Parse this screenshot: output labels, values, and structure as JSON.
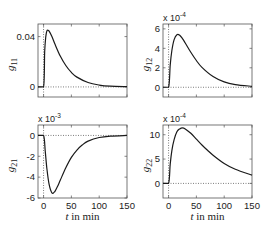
{
  "chart_data": [
    {
      "type": "line",
      "panel": "top-left",
      "ylabel": "g",
      "ylabel_sub": "11",
      "xlabel": "",
      "xlim": [
        -10,
        150
      ],
      "ylim": [
        -0.008,
        0.05
      ],
      "yticks": [
        0,
        0.04
      ],
      "ytick_labels": [
        "0",
        "0.04"
      ],
      "xticks": [
        0,
        50,
        100,
        150
      ],
      "xtick_labels": [],
      "multiplier": "",
      "grid": false,
      "reference_lines": {
        "y0": true,
        "x0": true
      },
      "curve": {
        "peak_t": 8,
        "peak_val": 0.045,
        "shape": "impulse-response"
      },
      "x": [
        -10,
        0,
        2,
        4,
        6,
        8,
        10,
        15,
        20,
        30,
        40,
        50,
        60,
        80,
        100,
        120,
        150
      ],
      "values": [
        0,
        0,
        0.028,
        0.04,
        0.0445,
        0.045,
        0.0443,
        0.04,
        0.0345,
        0.0245,
        0.017,
        0.0115,
        0.0078,
        0.0035,
        0.0015,
        0.0006,
        0.0002
      ]
    },
    {
      "type": "line",
      "panel": "top-right",
      "ylabel": "g",
      "ylabel_sub": "12",
      "xlabel": "",
      "xlim": [
        -10,
        150
      ],
      "ylim": [
        -1,
        6.5
      ],
      "yticks": [
        0,
        2,
        4,
        6
      ],
      "ytick_labels": [
        "0",
        "2",
        "4",
        "6"
      ],
      "xticks": [
        0,
        50,
        100,
        150
      ],
      "xtick_labels": [],
      "multiplier": "x 10",
      "multiplier_exp": "-4",
      "grid": false,
      "reference_lines": {
        "y0": true,
        "x0": true
      },
      "x": [
        -10,
        0,
        3,
        6,
        10,
        15,
        20,
        25,
        30,
        40,
        50,
        60,
        80,
        100,
        120,
        150
      ],
      "values": [
        0,
        0,
        2.3,
        3.8,
        4.9,
        5.4,
        5.35,
        5.0,
        4.55,
        3.6,
        2.75,
        2.05,
        1.1,
        0.55,
        0.28,
        0.1
      ]
    },
    {
      "type": "line",
      "panel": "bottom-left",
      "ylabel": "g",
      "ylabel_sub": "21",
      "xlabel": "t  in min",
      "xlim": [
        -10,
        150
      ],
      "ylim": [
        -6,
        1
      ],
      "yticks": [
        -6,
        -4,
        -2,
        0
      ],
      "ytick_labels": [
        "-6",
        "-4",
        "-2",
        "0"
      ],
      "xticks": [
        0,
        50,
        100,
        150
      ],
      "xtick_labels": [
        "0",
        "50",
        "100",
        "150"
      ],
      "multiplier": "x 10",
      "multiplier_exp": "-3",
      "grid": false,
      "reference_lines": {
        "y0": true,
        "x0": true
      },
      "x": [
        -10,
        0,
        3,
        6,
        10,
        15,
        20,
        25,
        30,
        40,
        50,
        60,
        70,
        80,
        100,
        120,
        150
      ],
      "values": [
        0,
        0,
        -1.5,
        -3.2,
        -4.7,
        -5.5,
        -5.4,
        -4.9,
        -4.3,
        -3.1,
        -2.1,
        -1.4,
        -0.9,
        -0.55,
        -0.2,
        -0.06,
        0
      ]
    },
    {
      "type": "line",
      "panel": "bottom-right",
      "ylabel": "g",
      "ylabel_sub": "22",
      "xlabel": "t  in min",
      "xlim": [
        -10,
        150
      ],
      "ylim": [
        -3,
        12
      ],
      "yticks": [
        0,
        5,
        10
      ],
      "ytick_labels": [
        "0",
        "5",
        "10"
      ],
      "xticks": [
        0,
        50,
        100,
        150
      ],
      "xtick_labels": [
        "0",
        "50",
        "100",
        "150"
      ],
      "multiplier": "x 10",
      "multiplier_exp": "-4",
      "grid": false,
      "reference_lines": {
        "y0": true,
        "x0": true
      },
      "x": [
        -10,
        0,
        3,
        6,
        10,
        15,
        20,
        25,
        30,
        40,
        50,
        60,
        70,
        80,
        100,
        120,
        150
      ],
      "values": [
        0,
        0,
        4.0,
        6.8,
        9.0,
        10.6,
        11.2,
        11.4,
        11.2,
        10.3,
        9.1,
        7.9,
        6.8,
        5.8,
        4.1,
        2.9,
        1.7
      ]
    }
  ],
  "layout": {
    "panels": [
      {
        "left": 38,
        "top": 24,
        "right": 127,
        "bottom": 97
      },
      {
        "left": 163,
        "top": 24,
        "right": 252,
        "bottom": 97
      },
      {
        "left": 38,
        "top": 125,
        "right": 127,
        "bottom": 198
      },
      {
        "left": 163,
        "top": 125,
        "right": 252,
        "bottom": 198
      }
    ]
  }
}
